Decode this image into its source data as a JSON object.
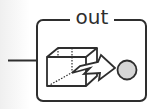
{
  "node": {
    "title": "out",
    "type": "output-port-block",
    "icon": "cube-arrow-to-circle-icon"
  },
  "colors": {
    "stroke": "#2e2e2e",
    "port_fill": "#d6d6d6",
    "background": "#ffffff"
  }
}
